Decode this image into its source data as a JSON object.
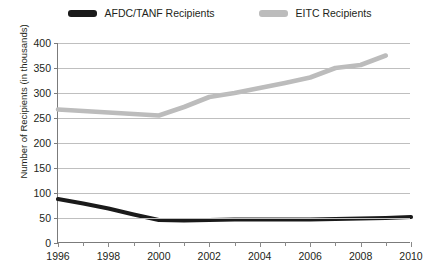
{
  "legend": {
    "position": "top-center",
    "entries": [
      {
        "label": "AFDC/TANF Recipients",
        "color": "#1a1a1a",
        "swatch_name": "legend-swatch-afdc"
      },
      {
        "label": "EITC Recipients",
        "color": "#bcbcbc",
        "swatch_name": "legend-swatch-eitc"
      }
    ]
  },
  "axes": {
    "ylabel": "Number of Recipients (in thousands)",
    "xlabel": "",
    "yticks": [
      0,
      50,
      100,
      150,
      200,
      250,
      300,
      350,
      400
    ],
    "xticks_major": [
      1996,
      1998,
      2000,
      2002,
      2004,
      2006,
      2008,
      2010
    ],
    "xticks_minor": [
      1997,
      1999,
      2001,
      2003,
      2005,
      2007,
      2009
    ]
  },
  "chart_data": {
    "type": "line",
    "title": "",
    "subtitle": "",
    "xlabel": "",
    "ylabel": "Number of Recipients (in thousands)",
    "xlim": [
      1996,
      2010
    ],
    "ylim": [
      0,
      400
    ],
    "grid": "horizontal",
    "legend_position": "top-center",
    "x": [
      1996,
      1997,
      1998,
      1999,
      2000,
      2001,
      2002,
      2003,
      2004,
      2005,
      2006,
      2007,
      2008,
      2009,
      2010
    ],
    "series": [
      {
        "name": "AFDC/TANF Recipients",
        "color": "#1a1a1a",
        "values": [
          88,
          79,
          69,
          57,
          46,
          45,
          46,
          47,
          47,
          47,
          47,
          48,
          49,
          50,
          52
        ]
      },
      {
        "name": "EITC Recipients",
        "color": "#bcbcbc",
        "values": [
          267,
          264,
          261,
          258,
          255,
          272,
          292,
          300,
          310,
          320,
          331,
          350,
          356,
          375,
          null
        ]
      }
    ],
    "annotations": []
  }
}
